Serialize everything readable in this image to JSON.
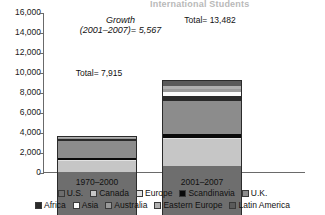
{
  "title": "International Students",
  "chart_data": {
    "type": "bar",
    "subtype": "stacked",
    "title": "International Students",
    "xlabel": "",
    "ylabel": "",
    "ylim": [
      0,
      16000
    ],
    "ytick_labels": [
      "16,000",
      "14,000",
      "12,000",
      "10,000",
      "8,000",
      "6,000",
      "4,000",
      "2,000",
      "0"
    ],
    "ytick_values": [
      16000,
      14000,
      12000,
      10000,
      8000,
      6000,
      4000,
      2000,
      0
    ],
    "grid": false,
    "legend_position": "bottom",
    "categories": [
      "1970–2000",
      "2001–2007"
    ],
    "series": [
      {
        "name": "U.S.",
        "key": "us",
        "color": "#6e6e6e",
        "values": [
          4400,
          5000
        ]
      },
      {
        "name": "Canada",
        "key": "canada",
        "color": "#c6c6c6",
        "values": [
          1100,
          2700
        ]
      },
      {
        "name": "Europe",
        "key": "europe",
        "color": "#e2e2e2",
        "values": [
          60,
          150
        ]
      },
      {
        "name": "Scandinavia",
        "key": "scand",
        "color": "#0a0a0a",
        "values": [
          250,
          400
        ]
      },
      {
        "name": "U.K.",
        "key": "uk",
        "color": "#8c8c8c",
        "values": [
          1700,
          3300
        ]
      },
      {
        "name": "Africa",
        "key": "africa",
        "color": "#2a2a2a",
        "values": [
          150,
          500
        ]
      },
      {
        "name": "Asia",
        "key": "asia",
        "color": "#fbfbfb",
        "values": [
          85,
          330
        ]
      },
      {
        "name": "Australia",
        "key": "australia",
        "color": "#9a9a9a",
        "values": [
          70,
          300
        ]
      },
      {
        "name": "Eastern Europe",
        "key": "eeurope",
        "color": "#b0b0b0",
        "values": [
          60,
          300
        ]
      },
      {
        "name": "Latin America",
        "key": "latin",
        "color": "#5a5a5a",
        "values": [
          40,
          502
        ]
      }
    ],
    "totals": [
      7915,
      13482
    ],
    "annotations": [
      {
        "name": "growth",
        "line1": "Growth",
        "line2": "(2001–2007)= 5,567",
        "value": 5567
      },
      {
        "name": "total-left",
        "text": "Total= 7,915",
        "value": 7915
      },
      {
        "name": "total-right",
        "text": "Total= 13,482",
        "value": 13482
      }
    ]
  },
  "axis": {
    "ticks": [
      "16,000",
      "14,000",
      "12,000",
      "10,000",
      "8,000",
      "6,000",
      "4,000",
      "2,000",
      "0"
    ]
  },
  "categories": {
    "left": "1970–2000",
    "right": "2001–2007"
  },
  "annotations": {
    "growth_line1": "Growth",
    "growth_line2": "(2001–2007)= 5,567",
    "total_left": "Total= 7,915",
    "total_right": "Total= 13,482"
  },
  "legend": {
    "row1": [
      {
        "label": "U.S.",
        "color": "#6e6e6e"
      },
      {
        "label": "Canada",
        "color": "#c6c6c6"
      },
      {
        "label": "Europe",
        "color": "#e2e2e2"
      },
      {
        "label": "Scandinavia",
        "color": "#0a0a0a"
      },
      {
        "label": "U.K.",
        "color": "#8c8c8c"
      }
    ],
    "row2": [
      {
        "label": "Africa",
        "color": "#2a2a2a"
      },
      {
        "label": "Asia",
        "color": "#fbfbfb"
      },
      {
        "label": "Australia",
        "color": "#9a9a9a"
      },
      {
        "label": "Eastern Europe",
        "color": "#b0b0b0"
      },
      {
        "label": "Latin America",
        "color": "#5a5a5a"
      }
    ]
  }
}
